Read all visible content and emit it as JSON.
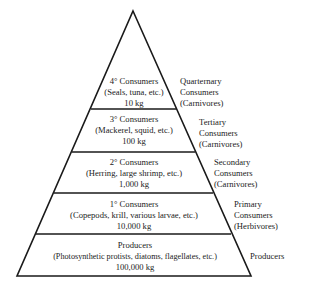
{
  "diagram": {
    "type": "ecological-biomass-pyramid",
    "levels": [
      {
        "title": "4° Consumers",
        "examples": "(Seals, tuna, etc.)",
        "biomass": "10 kg",
        "side": [
          "Quarternary",
          "Consumers",
          "(Carnivores)"
        ]
      },
      {
        "title": "3° Consumers",
        "examples": "(Mackerel, squid, etc.)",
        "biomass": "100 kg",
        "side": [
          "Tertiary",
          "Consumers",
          "(Carnivores)"
        ]
      },
      {
        "title": "2° Consumers",
        "examples": "(Herring, large shrimp, etc.)",
        "biomass": "1,000 kg",
        "side": [
          "Secondary",
          "Consumers",
          "(Carnivores)"
        ]
      },
      {
        "title": "1° Consumers",
        "examples": "(Copepods, krill, various larvae, etc.)",
        "biomass": "10,000 kg",
        "side": [
          "Primary",
          "Consumers",
          "(Herbivores)"
        ]
      },
      {
        "title": "Producers",
        "examples": "(Photosynthetic protists, diatoms, flagellates, etc.)",
        "biomass": "100,000 kg",
        "side": [
          "Producers"
        ]
      }
    ],
    "colors": {
      "line": "#1a1a1a",
      "text": "#222222",
      "background": "#ffffff"
    }
  }
}
